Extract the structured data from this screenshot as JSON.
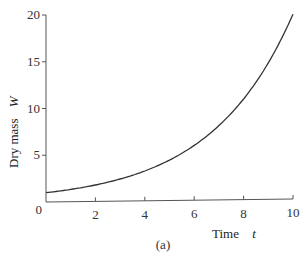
{
  "chart_data": {
    "type": "line",
    "title": "",
    "caption": "(a)",
    "xlabel": "Time",
    "xlabel_var": "t",
    "ylabel": "Dry mass",
    "ylabel_var": "W",
    "xlim": [
      0,
      10
    ],
    "ylim": [
      0,
      20
    ],
    "xticks": [
      0,
      2,
      4,
      6,
      8,
      10
    ],
    "yticks": [
      0,
      5,
      10,
      15,
      20
    ],
    "grid": false,
    "legend": null,
    "series": [
      {
        "name": "W = e^(0.3t)",
        "x": [
          0,
          1,
          2,
          3,
          4,
          5,
          6,
          7,
          8,
          9,
          10
        ],
        "y": [
          1.0,
          1.35,
          1.82,
          2.46,
          3.32,
          4.48,
          6.05,
          8.17,
          11.02,
          14.88,
          20.09
        ]
      }
    ],
    "colors": {
      "line": "#333333",
      "axis": "#555555"
    }
  },
  "labels": {
    "x_axis": "Time",
    "x_var": "t",
    "y_axis": "Dry mass",
    "y_var": "W",
    "caption": "(a)"
  }
}
